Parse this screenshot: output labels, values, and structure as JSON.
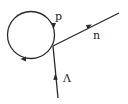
{
  "diagram": {
    "type": "feynman-diagram",
    "lines": [
      {
        "id": "loop",
        "label": "p",
        "kind": "loop",
        "direction": "clockwise"
      },
      {
        "id": "outgoing",
        "label": "n",
        "kind": "outgoing"
      },
      {
        "id": "incoming",
        "label": "Λ",
        "kind": "incoming"
      }
    ],
    "labels": {
      "loop": "p",
      "outgoing": "n",
      "incoming": "Λ"
    },
    "colors": {
      "line": "#2a2a2a",
      "background": "#ffffff"
    }
  }
}
